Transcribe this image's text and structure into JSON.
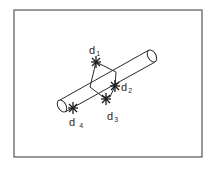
{
  "figure": {
    "colors": {
      "background": "#ffffff",
      "stroke": "#2a2a2a",
      "frame": "#555555"
    },
    "frame": {
      "x": 14,
      "y": 10,
      "width": 188,
      "height": 147
    },
    "cylinder": {
      "left_cap": {
        "cx": 62,
        "cy": 106,
        "rx": 4,
        "ry": 6.5
      },
      "right_cap": {
        "cx": 152,
        "cy": 56,
        "rx": 4,
        "ry": 6.5
      },
      "top_edge": {
        "x1": 60,
        "y1": 100,
        "x2": 149,
        "y2": 50
      },
      "bottom_edge": {
        "x1": 65,
        "y1": 112,
        "x2": 155,
        "y2": 62
      }
    },
    "points": [
      {
        "id": "d1",
        "label": "d",
        "subscript": "1",
        "x": 96,
        "y": 62,
        "label_x": 89,
        "label_y": 45
      },
      {
        "id": "d2",
        "label": "d",
        "subscript": "2",
        "x": 115,
        "y": 86,
        "label_x": 121,
        "label_y": 82
      },
      {
        "id": "d3",
        "label": "d",
        "subscript": "3",
        "x": 106,
        "y": 99,
        "label_x": 107,
        "label_y": 111
      },
      {
        "id": "d4",
        "label": "d",
        "subscript": "4",
        "x": 73,
        "y": 108,
        "label_x": 69,
        "label_y": 117
      }
    ],
    "quadrilateral": [
      {
        "x": 96,
        "y": 62
      },
      {
        "x": 116,
        "y": 72
      },
      {
        "x": 115,
        "y": 86
      },
      {
        "x": 110,
        "y": 97
      },
      {
        "x": 103,
        "y": 97
      },
      {
        "x": 90,
        "y": 87
      }
    ]
  }
}
